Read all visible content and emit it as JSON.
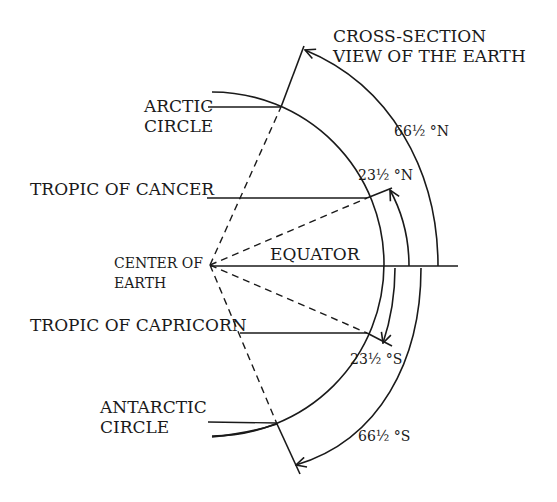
{
  "title": {
    "line1": "CROSS-SECTION",
    "line2": "VIEW OF THE EARTH"
  },
  "labels": {
    "arctic_circle": {
      "line1": "ARCTIC",
      "line2": "CIRCLE"
    },
    "tropic_of_cancer": "TROPIC OF CANCER",
    "center_of_earth": {
      "line1": "CENTER OF",
      "line2": "EARTH"
    },
    "equator": "EQUATOR",
    "tropic_of_capricorn": "TROPIC OF CAPRICORN",
    "antarctic_circle": {
      "line1": "ANTARCTIC",
      "line2": "CIRCLE"
    }
  },
  "angles": {
    "north_66": "66½ °N",
    "north_23": "23½ °N",
    "south_23": "23½ °S",
    "south_66": "66½ °S"
  },
  "colors": {
    "ink": "#1a1a1a",
    "background": "#ffffff"
  }
}
